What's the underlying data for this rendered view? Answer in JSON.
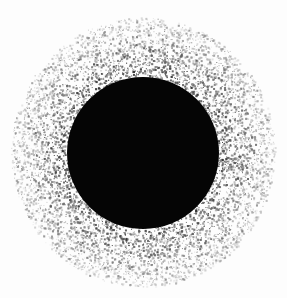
{
  "image": {
    "subject": "black disc with speckled halo",
    "background_color": "#fdfdfd",
    "disc": {
      "cx": 143,
      "cy": 153,
      "r": 76,
      "color": "#050505"
    },
    "halo": {
      "cx": 143,
      "cy": 152,
      "r_outer": 132,
      "r_inner": 70,
      "dot_color": "#3a3a3a",
      "density": 9000
    }
  }
}
